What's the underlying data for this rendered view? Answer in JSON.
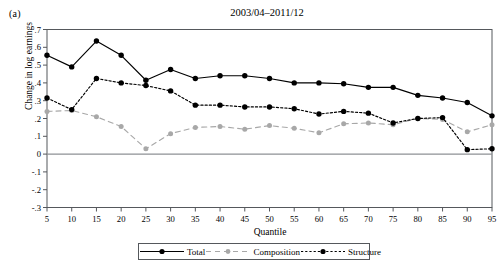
{
  "panel": {
    "label": "(a)"
  },
  "chart_data": {
    "type": "line",
    "title": "2003/04–2011/12",
    "xlabel": "Quantile",
    "ylabel": "Change in log earnings",
    "x": [
      5,
      10,
      15,
      20,
      25,
      30,
      35,
      40,
      45,
      50,
      55,
      60,
      65,
      70,
      75,
      80,
      85,
      90,
      95
    ],
    "categories": [
      "5",
      "10",
      "15",
      "20",
      "25",
      "30",
      "35",
      "40",
      "45",
      "50",
      "55",
      "60",
      "65",
      "70",
      "75",
      "80",
      "85",
      "90",
      "95"
    ],
    "xlim": [
      5,
      95
    ],
    "ylim": [
      -0.3,
      0.7
    ],
    "ytick_labels": [
      ".7",
      ".6",
      ".5",
      ".4",
      ".3",
      ".2",
      ".1",
      "0",
      "-.1",
      "-.2",
      "-.3"
    ],
    "ytick_values": [
      0.7,
      0.6,
      0.5,
      0.4,
      0.3,
      0.2,
      0.1,
      0,
      -0.1,
      -0.2,
      -0.3
    ],
    "grid": false,
    "zero_line": true,
    "legend_position": "bottom",
    "series": [
      {
        "name": "Total",
        "color": "#000000",
        "style": "solid",
        "marker": "circle-filled",
        "values": [
          0.555,
          0.49,
          0.635,
          0.555,
          0.415,
          0.475,
          0.425,
          0.44,
          0.44,
          0.425,
          0.4,
          0.4,
          0.395,
          0.375,
          0.375,
          0.33,
          0.315,
          0.29,
          0.215
        ]
      },
      {
        "name": "Composition",
        "color": "#a8a8a8",
        "style": "dashed",
        "marker": "circle-filled",
        "values": [
          0.24,
          0.245,
          0.21,
          0.155,
          0.03,
          0.115,
          0.15,
          0.155,
          0.14,
          0.16,
          0.145,
          0.12,
          0.17,
          0.175,
          0.165,
          0.2,
          0.195,
          0.125,
          0.165
        ]
      },
      {
        "name": "Structure",
        "color": "#000000",
        "style": "dotted",
        "marker": "circle-filled",
        "values": [
          0.315,
          0.25,
          0.425,
          0.4,
          0.385,
          0.355,
          0.275,
          0.275,
          0.265,
          0.265,
          0.255,
          0.225,
          0.24,
          0.23,
          0.175,
          0.2,
          0.205,
          0.025,
          0.03
        ]
      }
    ]
  },
  "legend": {
    "items": [
      {
        "label": "Total"
      },
      {
        "label": "Composition"
      },
      {
        "label": "Structure"
      }
    ]
  }
}
